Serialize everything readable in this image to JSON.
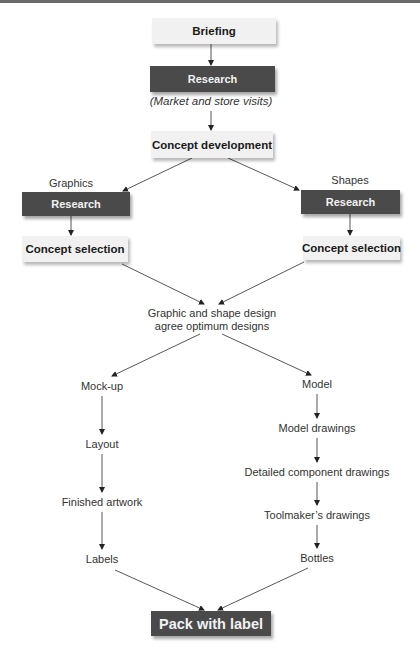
{
  "diagram": {
    "nodes": {
      "briefing": "Briefing",
      "research_main": "Research",
      "research_note": "(Market and store visits)",
      "concept_development": "Concept development",
      "branch_left_label": "Graphics",
      "branch_right_label": "Shapes",
      "research_left": "Research",
      "research_right": "Research",
      "concept_selection_left": "Concept selection",
      "concept_selection_right": "Concept selection",
      "merge_line1": "Graphic and shape design",
      "merge_line2": "agree optimum designs",
      "left_steps": [
        "Mock-up",
        "Layout",
        "Finished artwork",
        "Labels"
      ],
      "right_steps": [
        "Model",
        "Model drawings",
        "Detailed component drawings",
        "Toolmaker’s drawings",
        "Bottles"
      ],
      "final": "Pack with label"
    },
    "colors": {
      "light_box": "#f1f1f1",
      "dark_box": "#4a4a4a",
      "line": "#333333"
    }
  }
}
